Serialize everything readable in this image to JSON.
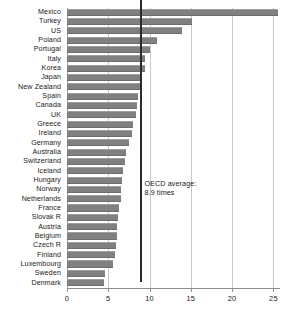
{
  "chart_data": {
    "type": "bar",
    "orientation": "horizontal",
    "title": "",
    "subtitle": "",
    "xlabel": "",
    "ylabel": "",
    "xlim": [
      0,
      25.8
    ],
    "ylim": null,
    "grid": true,
    "legend": null,
    "xticks": [
      0,
      5,
      10,
      15,
      20,
      25
    ],
    "xtick_labels": [
      "0",
      "5",
      "10",
      "15",
      "20",
      "25"
    ],
    "categories": [
      "Mexico",
      "Turkey",
      "US",
      "Poland",
      "Portugal",
      "Italy",
      "Korea",
      "Japan",
      "New Zealand",
      "Spain",
      "Canada",
      "UK",
      "Greece",
      "Ireland",
      "Germany",
      "Australia",
      "Switzerland",
      "Iceland",
      "Hungary",
      "Norway",
      "Netherlands",
      "France",
      "Slovak R",
      "Austria",
      "Belgium",
      "Czech R",
      "Finland",
      "Luxembourg",
      "Sweden",
      "Denmark"
    ],
    "values": [
      25.5,
      15.1,
      13.9,
      10.9,
      10.1,
      9.5,
      9.4,
      8.9,
      8.8,
      8.6,
      8.5,
      8.4,
      8.0,
      7.9,
      7.5,
      7.2,
      7.0,
      6.8,
      6.7,
      6.6,
      6.5,
      6.3,
      6.2,
      6.1,
      6.0,
      5.9,
      5.8,
      5.6,
      4.6,
      4.5
    ],
    "annotations": [
      {
        "name": "oecd-average",
        "text_line1": "OECD average:",
        "text_line2": "8.9 times",
        "value": 8.9,
        "line": true
      }
    ],
    "colors": {
      "bar": "#808080",
      "grid": "#c9c9c9",
      "axis": "#8d8d8d",
      "average_line": "#2b2b2b",
      "background": "#ffffff",
      "text": "#1a1a1a"
    }
  }
}
